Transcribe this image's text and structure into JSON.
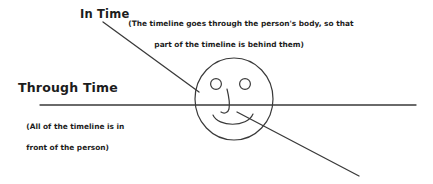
{
  "diagram": {
    "title_in_time": "In Time",
    "title_through_time": "Through Time",
    "note_in_time_line1": "(The timeline goes through the person's body, so that",
    "note_in_time_line2": "part of the timeline is behind them)",
    "note_through_time_line1": "(All of the timeline is in",
    "note_through_time_line2": "front of the person)",
    "colors": {
      "ink": "#3a3a3a",
      "text": "#1c1c1c",
      "background": "#ffffff"
    },
    "shapes": {
      "head_label": "face-circle",
      "eye_left_label": "left-eye",
      "eye_right_label": "right-eye",
      "nose_label": "nose",
      "mouth_label": "mouth",
      "through_time_line_label": "horizontal-timeline",
      "in_time_line_label": "diagonal-timeline"
    }
  }
}
